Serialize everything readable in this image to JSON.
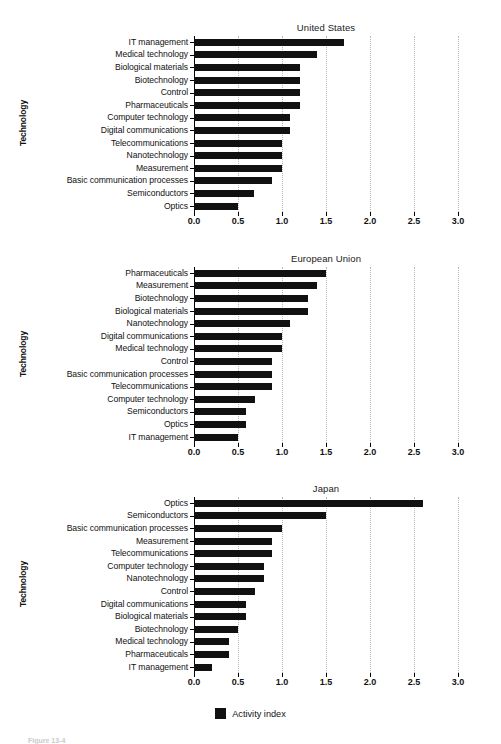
{
  "figure": {
    "caption": "Figure 13-4",
    "ylabel": "Technology",
    "legend_label": "Activity index"
  },
  "axis": {
    "ticks": [
      "0.0",
      "0.5",
      "1.0",
      "1.5",
      "2.0",
      "2.5",
      "3.0"
    ],
    "tick_values": [
      0.0,
      0.5,
      1.0,
      1.5,
      2.0,
      2.5,
      3.0
    ],
    "min": 0.0,
    "max": 3.0
  },
  "colors": {
    "bar": "#111111",
    "grid": "#b8b8b8",
    "axis": "#000000",
    "background": "#ffffff"
  },
  "panels": [
    {
      "title": "United States",
      "categories": [
        "IT management",
        "Medical technology",
        "Biological materials",
        "Biotechnology",
        "Control",
        "Pharmaceuticals",
        "Computer technology",
        "Digital communications",
        "Telecommunications",
        "Nanotechnology",
        "Measurement",
        "Basic communication processes",
        "Semiconductors",
        "Optics"
      ],
      "values": [
        1.7,
        1.4,
        1.2,
        1.2,
        1.2,
        1.2,
        1.09,
        1.09,
        1.0,
        1.0,
        1.0,
        0.89,
        0.68,
        0.5
      ]
    },
    {
      "title": "European Union",
      "categories": [
        "Pharmaceuticals",
        "Measurement",
        "Biotechnology",
        "Biological materials",
        "Nanotechnology",
        "Digital communications",
        "Medical technology",
        "Control",
        "Basic communication processes",
        "Telecommunications",
        "Computer technology",
        "Semiconductors",
        "Optics",
        "IT management"
      ],
      "values": [
        1.5,
        1.4,
        1.29,
        1.29,
        1.09,
        1.0,
        1.0,
        0.89,
        0.89,
        0.89,
        0.69,
        0.59,
        0.59,
        0.5
      ]
    },
    {
      "title": "Japan",
      "categories": [
        "Optics",
        "Semiconductors",
        "Basic communication processes",
        "Measurement",
        "Telecommunications",
        "Computer technology",
        "Nanotechnology",
        "Control",
        "Digital communications",
        "Biological materials",
        "Biotechnology",
        "Medical technology",
        "Pharmaceuticals",
        "IT management"
      ],
      "values": [
        2.6,
        1.5,
        1.0,
        0.89,
        0.89,
        0.79,
        0.79,
        0.69,
        0.59,
        0.59,
        0.5,
        0.4,
        0.4,
        0.2
      ]
    }
  ],
  "chart_data": {
    "type": "bar",
    "orientation": "horizontal",
    "xlabel": "Activity index",
    "ylabel": "Technology",
    "xlim": [
      0.0,
      3.0
    ],
    "xticks": [
      0.0,
      0.5,
      1.0,
      1.5,
      2.0,
      2.5,
      3.0
    ],
    "grid": "vertical-dotted",
    "legend": [
      "Activity index"
    ],
    "legend_position": "bottom-center",
    "panels": [
      {
        "title": "United States",
        "categories": [
          "IT management",
          "Medical technology",
          "Biological materials",
          "Biotechnology",
          "Control",
          "Pharmaceuticals",
          "Computer technology",
          "Digital communications",
          "Telecommunications",
          "Nanotechnology",
          "Measurement",
          "Basic communication processes",
          "Semiconductors",
          "Optics"
        ],
        "values": [
          1.7,
          1.4,
          1.2,
          1.2,
          1.2,
          1.2,
          1.09,
          1.09,
          1.0,
          1.0,
          1.0,
          0.89,
          0.68,
          0.5
        ]
      },
      {
        "title": "European Union",
        "categories": [
          "Pharmaceuticals",
          "Measurement",
          "Biotechnology",
          "Biological materials",
          "Nanotechnology",
          "Digital communications",
          "Medical technology",
          "Control",
          "Basic communication processes",
          "Telecommunications",
          "Computer technology",
          "Semiconductors",
          "Optics",
          "IT management"
        ],
        "values": [
          1.5,
          1.4,
          1.29,
          1.29,
          1.09,
          1.0,
          1.0,
          0.89,
          0.89,
          0.89,
          0.69,
          0.59,
          0.59,
          0.5
        ]
      },
      {
        "title": "Japan",
        "categories": [
          "Optics",
          "Semiconductors",
          "Basic communication processes",
          "Measurement",
          "Telecommunications",
          "Computer technology",
          "Nanotechnology",
          "Control",
          "Digital communications",
          "Biological materials",
          "Biotechnology",
          "Medical technology",
          "Pharmaceuticals",
          "IT management"
        ],
        "values": [
          2.6,
          1.5,
          1.0,
          0.89,
          0.89,
          0.79,
          0.79,
          0.69,
          0.59,
          0.59,
          0.5,
          0.4,
          0.4,
          0.2
        ]
      }
    ]
  }
}
